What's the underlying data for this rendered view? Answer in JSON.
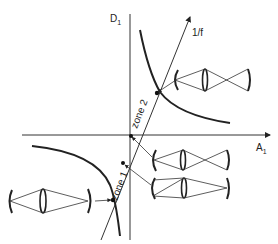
{
  "axes": {
    "x_label": "A",
    "x_subscript": "1",
    "y_label": "D",
    "y_subscript": "1"
  },
  "line_label": "1/f",
  "zones": [
    {
      "label": "zone 1"
    },
    {
      "label": "zone 2"
    }
  ],
  "colors": {
    "ink": "#222222",
    "background": "#ffffff"
  }
}
